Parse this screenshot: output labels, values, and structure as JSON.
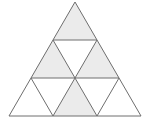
{
  "diagram": {
    "title": "",
    "colors": {
      "background": "#ffffff",
      "shaded": "#ebebeb",
      "unshaded": "#ffffff",
      "line": "#6e6e6e"
    },
    "rows": 3,
    "small_triangles": [
      {
        "row": 1,
        "pos": 1,
        "orientation": "up",
        "shaded": true
      },
      {
        "row": 2,
        "pos": 1,
        "orientation": "up",
        "shaded": true
      },
      {
        "row": 2,
        "pos": 2,
        "orientation": "down",
        "shaded": false
      },
      {
        "row": 2,
        "pos": 3,
        "orientation": "up",
        "shaded": true
      },
      {
        "row": 3,
        "pos": 1,
        "orientation": "up",
        "shaded": false
      },
      {
        "row": 3,
        "pos": 2,
        "orientation": "down",
        "shaded": false
      },
      {
        "row": 3,
        "pos": 3,
        "orientation": "up",
        "shaded": true
      },
      {
        "row": 3,
        "pos": 4,
        "orientation": "down",
        "shaded": false
      },
      {
        "row": 3,
        "pos": 5,
        "orientation": "up",
        "shaded": false
      }
    ],
    "shaded_count": 4,
    "total_count": 9
  }
}
